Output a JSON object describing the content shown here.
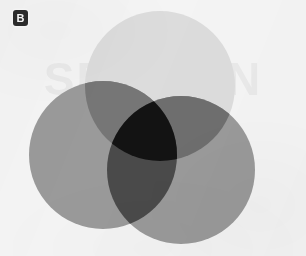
{
  "panel": {
    "label": "B",
    "background_color": "#f4f4f4",
    "badge_color": "#2b2b2b",
    "badge_text_color": "#f6f6f6",
    "width": 306,
    "height": 256
  },
  "watermark": {
    "text": "SECTION"
  },
  "chart_data": {
    "type": "venn",
    "title": "",
    "subtitle": "",
    "xlabel": "",
    "ylabel": "",
    "grid": false,
    "legend_position": "none",
    "blend_mode": "multiply",
    "sets": [
      {
        "name": "top",
        "label": "",
        "cx": 160,
        "cy": 86,
        "r": 75,
        "fill": "#dcdcdc",
        "alone_color": "#dcdcdc"
      },
      {
        "name": "left",
        "label": "",
        "cx": 103,
        "cy": 155,
        "r": 74,
        "fill": "#9a9a9a",
        "alone_color": "#9a9a9a"
      },
      {
        "name": "right",
        "label": "",
        "cx": 181,
        "cy": 170,
        "r": 74,
        "fill": "#9a9a9a",
        "alone_color": "#9a9a9a"
      }
    ],
    "overlaps": [
      {
        "sets": [
          "top",
          "left"
        ],
        "color": "#767676"
      },
      {
        "sets": [
          "top",
          "right"
        ],
        "color": "#6e6e6e"
      },
      {
        "sets": [
          "left",
          "right"
        ],
        "color": "#4a4a4a"
      },
      {
        "sets": [
          "top",
          "left",
          "right"
        ],
        "color": "#131313"
      }
    ],
    "annotations": []
  }
}
